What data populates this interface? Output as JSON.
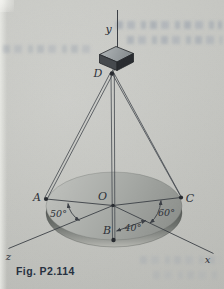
{
  "figure_type": "statics tripod-cable diagram (textbook scan)",
  "caption": {
    "text": "Fig. P2.114"
  },
  "labels": {
    "axis_y": "y",
    "axis_x": "x",
    "axis_z": "z",
    "point_d": "D",
    "point_o": "O",
    "point_a": "A",
    "point_b": "B",
    "point_c": "C"
  },
  "angles": {
    "a_to_z": "50°",
    "b_to_x": "40°",
    "c_to_x": "60°"
  },
  "colors": {
    "paper": "#c8c9c4",
    "ink": "#3a3e44",
    "label_ink": "#2c3037",
    "caption_ink": "#252f3e",
    "disk_top_light": "#b9bbb7",
    "disk_top_dark": "#8d908c",
    "rim_dark": "#4f534f",
    "rim_light": "#b7b8b2",
    "cube_top_light": "#abb0b3",
    "cube_left_face": "#44484c",
    "cube_right_face": "#272a2e"
  }
}
